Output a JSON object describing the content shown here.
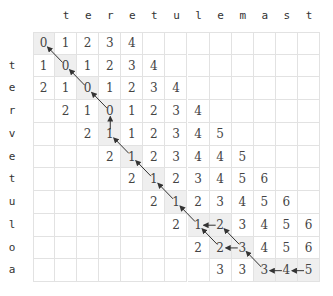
{
  "diagram": {
    "column_word": [
      "t",
      "e",
      "r",
      "e",
      "t",
      "u",
      "l",
      "e",
      "m",
      "a",
      "s",
      "t"
    ],
    "row_word": [
      "t",
      "e",
      "r",
      "v",
      "e",
      "t",
      "u",
      "l",
      "o",
      "a"
    ],
    "cells": [
      [
        0,
        1,
        2,
        3,
        4,
        null,
        null,
        null,
        null,
        null,
        null,
        null,
        null
      ],
      [
        1,
        0,
        1,
        2,
        3,
        4,
        null,
        null,
        null,
        null,
        null,
        null,
        null
      ],
      [
        2,
        1,
        0,
        1,
        2,
        3,
        4,
        null,
        null,
        null,
        null,
        null,
        null
      ],
      [
        null,
        2,
        1,
        0,
        1,
        2,
        3,
        4,
        null,
        null,
        null,
        null,
        null
      ],
      [
        null,
        null,
        2,
        1,
        1,
        2,
        3,
        4,
        5,
        null,
        null,
        null,
        null
      ],
      [
        null,
        null,
        null,
        2,
        1,
        2,
        3,
        4,
        4,
        5,
        null,
        null,
        null
      ],
      [
        null,
        null,
        null,
        null,
        2,
        1,
        2,
        3,
        4,
        5,
        6,
        null,
        null
      ],
      [
        null,
        null,
        null,
        null,
        null,
        2,
        1,
        2,
        3,
        4,
        5,
        6,
        null
      ],
      [
        null,
        null,
        null,
        null,
        null,
        null,
        2,
        1,
        2,
        3,
        4,
        5,
        6
      ],
      [
        null,
        null,
        null,
        null,
        null,
        null,
        null,
        2,
        2,
        3,
        4,
        5,
        6
      ],
      [
        null,
        null,
        null,
        null,
        null,
        null,
        null,
        null,
        3,
        3,
        3,
        4,
        5
      ]
    ],
    "shaded": [
      [
        0,
        0
      ],
      [
        1,
        1
      ],
      [
        2,
        2
      ],
      [
        3,
        3
      ],
      [
        4,
        3
      ],
      [
        5,
        4
      ],
      [
        6,
        5
      ],
      [
        7,
        6
      ],
      [
        8,
        7
      ],
      [
        8,
        8
      ],
      [
        9,
        8
      ],
      [
        9,
        9
      ],
      [
        10,
        10
      ],
      [
        10,
        11
      ],
      [
        10,
        12
      ]
    ],
    "arrows": [
      {
        "from": [
          1,
          1
        ],
        "to": [
          0,
          0
        ],
        "dir": "diag"
      },
      {
        "from": [
          2,
          2
        ],
        "to": [
          1,
          1
        ],
        "dir": "diag"
      },
      {
        "from": [
          3,
          3
        ],
        "to": [
          2,
          2
        ],
        "dir": "diag"
      },
      {
        "from": [
          4,
          3
        ],
        "to": [
          3,
          3
        ],
        "dir": "up"
      },
      {
        "from": [
          5,
          4
        ],
        "to": [
          4,
          3
        ],
        "dir": "diag"
      },
      {
        "from": [
          6,
          5
        ],
        "to": [
          5,
          4
        ],
        "dir": "diag"
      },
      {
        "from": [
          7,
          6
        ],
        "to": [
          6,
          5
        ],
        "dir": "diag"
      },
      {
        "from": [
          8,
          7
        ],
        "to": [
          7,
          6
        ],
        "dir": "diag"
      },
      {
        "from": [
          8,
          8
        ],
        "to": [
          8,
          7
        ],
        "dir": "left"
      },
      {
        "from": [
          9,
          8
        ],
        "to": [
          8,
          7
        ],
        "dir": "diag"
      },
      {
        "from": [
          9,
          9
        ],
        "to": [
          9,
          8
        ],
        "dir": "left"
      },
      {
        "from": [
          9,
          9
        ],
        "to": [
          8,
          8
        ],
        "dir": "diag"
      },
      {
        "from": [
          10,
          10
        ],
        "to": [
          9,
          9
        ],
        "dir": "diag"
      },
      {
        "from": [
          10,
          11
        ],
        "to": [
          10,
          10
        ],
        "dir": "left"
      },
      {
        "from": [
          10,
          12
        ],
        "to": [
          10,
          11
        ],
        "dir": "left"
      }
    ],
    "colors": {
      "grid_line": "#e2e2e2",
      "shade": "#efefef",
      "text": "#444444",
      "arrow": "#333333"
    }
  }
}
